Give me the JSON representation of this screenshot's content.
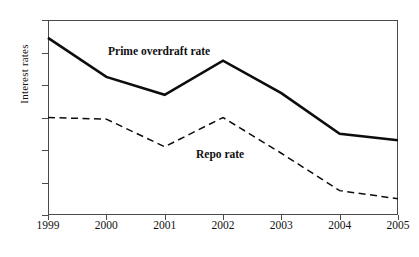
{
  "chart_data": {
    "type": "line",
    "title": "",
    "xlabel": "",
    "ylabel": "Interest rates",
    "categories": [
      "1999",
      "2000",
      "2001",
      "2002",
      "2003",
      "2004",
      "2005"
    ],
    "x": [
      1999,
      2000,
      2001,
      2002,
      2003,
      2004,
      2005
    ],
    "xlim": [
      1999,
      2005
    ],
    "ylim": [
      6,
      18
    ],
    "yticks": [
      18,
      16,
      14,
      12,
      10,
      8,
      6
    ],
    "xticks": [
      "1999",
      "2000",
      "2001",
      "2002",
      "2003",
      "2004",
      "2005"
    ],
    "grid": false,
    "legend_position": "inline-annotation",
    "series": [
      {
        "name": "Prime overdraft rate",
        "style": "solid",
        "color": "#0d0d0d",
        "values": [
          16.9,
          14.5,
          13.4,
          15.5,
          13.5,
          11.0,
          10.6
        ]
      },
      {
        "name": "Repo rate",
        "style": "dashed",
        "color": "#0d0d0d",
        "values": [
          12.0,
          11.9,
          10.2,
          12.0,
          9.8,
          7.5,
          7.0
        ]
      }
    ],
    "annotations": [
      {
        "text": "Prime overdraft rate",
        "series": "Prime overdraft rate"
      },
      {
        "text": "Repo rate",
        "series": "Repo rate"
      }
    ]
  },
  "axis": {
    "y_title": "Interest rates",
    "y_tick_labels": [
      "18",
      "16",
      "14",
      "12",
      "10",
      "8",
      "6"
    ],
    "x_tick_labels": [
      "1999",
      "2000",
      "2001",
      "2002",
      "2003",
      "2004",
      "2005"
    ]
  },
  "labels": {
    "prime": "Prime overdraft rate",
    "repo": "Repo rate"
  },
  "colors": {
    "axis": "#4a4a4a",
    "line": "#0d0d0d",
    "background": "#ffffff"
  }
}
